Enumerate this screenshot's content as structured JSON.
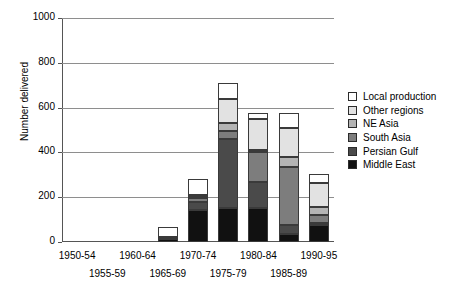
{
  "chart_data": {
    "type": "bar",
    "subtype": "stacked-vertical",
    "title": "",
    "xlabel": "",
    "ylabel": "Number delivered",
    "ylim": [
      0,
      1000
    ],
    "yticks": [
      0,
      200,
      400,
      600,
      800,
      1000
    ],
    "ytick_labels": [
      "0",
      "200",
      "400",
      "600",
      "800",
      "1000"
    ],
    "grid": "horizontal",
    "legend_position": "right",
    "categories": [
      "1950-54",
      "1955-59",
      "1960-64",
      "1965-69",
      "1970-74",
      "1975-79",
      "1980-84",
      "1985-89",
      "1990-95"
    ],
    "series": [
      {
        "name": "Middle East",
        "color": "#111111",
        "values": [
          0,
          0,
          0,
          15,
          145,
          150,
          150,
          35,
          75
        ]
      },
      {
        "name": "Persian Gulf",
        "color": "#4a4a4a",
        "values": [
          0,
          0,
          0,
          0,
          35,
          310,
          120,
          40,
          10
        ]
      },
      {
        "name": "South Asia",
        "color": "#7d7d7d",
        "values": [
          0,
          0,
          0,
          0,
          15,
          35,
          130,
          260,
          35
        ]
      },
      {
        "name": "NE Asia",
        "color": "#b4b4b4",
        "values": [
          0,
          0,
          0,
          8,
          5,
          35,
          10,
          45,
          35
        ]
      },
      {
        "name": "Other regions",
        "color": "#e2e2e2",
        "values": [
          0,
          0,
          0,
          0,
          10,
          110,
          140,
          130,
          110
        ]
      },
      {
        "name": "Local production",
        "color": "#ffffff",
        "values": [
          0,
          0,
          0,
          42,
          70,
          70,
          25,
          65,
          40
        ]
      }
    ],
    "totals": [
      0,
      0,
      0,
      65,
      280,
      710,
      575,
      575,
      305
    ],
    "legend_order_top_to_bottom": [
      "Local production",
      "Other regions",
      "NE Asia",
      "South Asia",
      "Persian Gulf",
      "Middle East"
    ]
  }
}
